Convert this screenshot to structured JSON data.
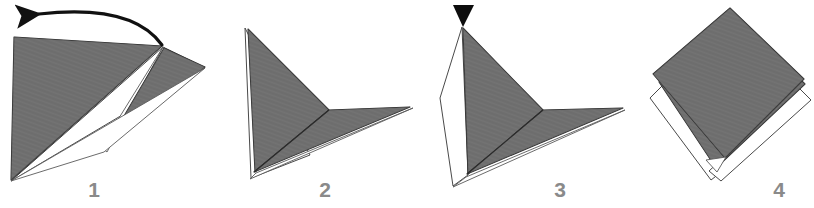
{
  "figure": {
    "kind": "origami-fold-instruction-sequence",
    "background_color": "#ffffff",
    "paper_front_color": "#6f6f6f",
    "paper_back_color": "#ffffff",
    "outline_color": "#2b2b2b",
    "label_color": "#8a8a8a",
    "arrow_color": "#111111",
    "marker_color": "#0d0d0d"
  },
  "steps": [
    {
      "id": "step-1",
      "number": "1",
      "label_x": 94,
      "label_y": 197,
      "annotation": "curved-arrow-left",
      "description": "Large gray triangle with a narrow white sliver and a second gray triangle folded to the right; curved arrow indicates folding leftward."
    },
    {
      "id": "step-2",
      "number": "2",
      "label_x": 325,
      "label_y": 197,
      "annotation": "none",
      "description": "Gray dart / arrowhead shape with thin white back-layer showing along lower left edge."
    },
    {
      "id": "step-3",
      "number": "3",
      "label_x": 560,
      "label_y": 197,
      "annotation": "black-triangle-pointer",
      "description": "Same dart shape with a white flap opened on the left side; black downward triangle marks the top apex."
    },
    {
      "id": "step-4",
      "number": "4",
      "label_x": 779,
      "label_y": 197,
      "annotation": "none",
      "description": "Completed gray diamond / square with white under-layers peeking out at the lower edges."
    }
  ],
  "annotations": {
    "curved_arrow": {
      "name": "fold-direction-arrow",
      "direction": "left",
      "shape": "curved-arc"
    },
    "pointer_triangle": {
      "name": "apex-pointer-marker",
      "direction": "down"
    }
  }
}
